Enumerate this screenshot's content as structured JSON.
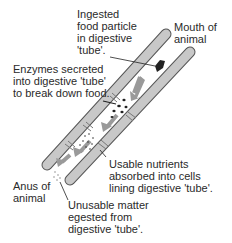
{
  "labels": {
    "ingested": [
      "Ingested",
      "food particle",
      "in digestive",
      "'tube'."
    ],
    "mouth": [
      "Mouth of",
      "animal"
    ],
    "enzymes": [
      "Enzymes secreted",
      "into digestive 'tube'",
      "to break down food."
    ],
    "nutrients": [
      "Usable nutrients",
      "absorbed into cells",
      "lining digestive 'tube'."
    ],
    "anus": [
      "Anus of",
      "animal"
    ],
    "unusable": [
      "Unusable matter",
      "egested from",
      "digestive 'tube'."
    ]
  },
  "colors": {
    "tube_fill": "#c8c8c8",
    "tube_stroke": "#555555",
    "arrow": "#9a9a9a",
    "food": "#222222"
  }
}
